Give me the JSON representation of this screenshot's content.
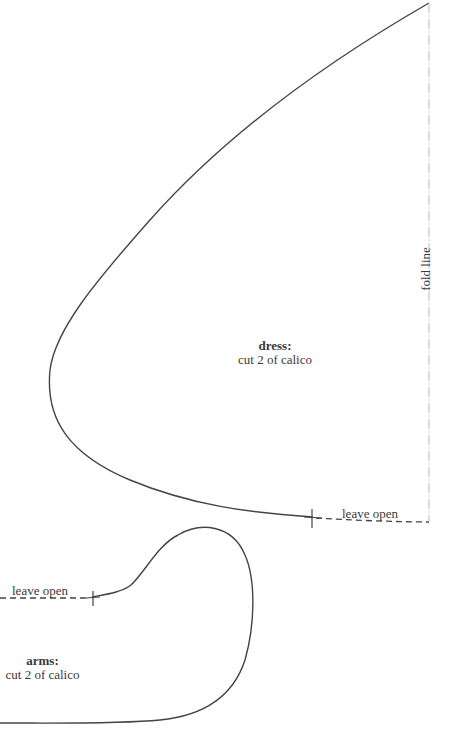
{
  "pattern": {
    "colors": {
      "outline": "#444444",
      "fold_line": "#bbbbbb",
      "text": "#3a3a3a",
      "background": "#ffffff"
    },
    "dress": {
      "title": "dress:",
      "instruction": "cut 2 of calico",
      "leave_open_label": "leave open",
      "fold_line_label": "fold line"
    },
    "arms": {
      "title": "arms:",
      "instruction": "cut 2 of calico",
      "leave_open_label": "leave open"
    }
  }
}
